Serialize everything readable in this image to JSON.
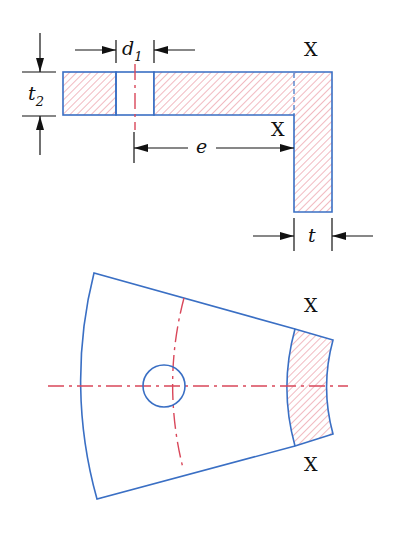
{
  "diagram": {
    "colors": {
      "outline": "#3a6fc4",
      "hatch": "#d9475a",
      "centerline": "#d9475a",
      "dimension": "#111111"
    },
    "top_view": {
      "section_label_top": "X",
      "section_label_bottom": "X",
      "dim_hole_diameter": {
        "symbol": "d",
        "subscript": "1"
      },
      "dim_thickness_plate": {
        "symbol": "t",
        "subscript": "2"
      },
      "dim_eccentricity": {
        "symbol": "e"
      },
      "dim_thickness": {
        "symbol": "t"
      }
    },
    "bottom_view": {
      "section_label_top": "X",
      "section_label_bottom": "X"
    }
  }
}
